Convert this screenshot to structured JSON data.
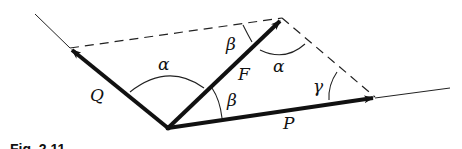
{
  "diagram": {
    "vectors": [
      {
        "name": "Q",
        "label": "Q"
      },
      {
        "name": "F",
        "label": "F"
      },
      {
        "name": "P",
        "label": "P"
      }
    ],
    "angles": {
      "alpha_left": "α",
      "alpha_right": "α",
      "beta_top": "β",
      "beta_bottom": "β",
      "gamma": "γ"
    },
    "caption": "Fig. 2.11"
  }
}
